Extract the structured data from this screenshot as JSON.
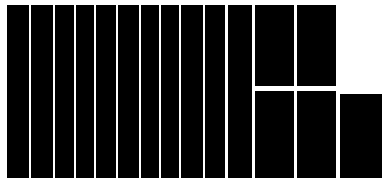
{
  "figure": {
    "background_color": "#ffffff",
    "tile_color": "#000000",
    "width": 389,
    "height": 189
  },
  "chart_data": {
    "type": "treemap",
    "title": "",
    "subtitle": "",
    "xlabel": "",
    "ylabel": "",
    "grid": false,
    "legend": "none",
    "labels_shown": false,
    "axis_shown": false,
    "layout": "squarified-treemap",
    "canvas": {
      "x": 0,
      "y": 0,
      "width": 389,
      "height": 189
    },
    "plot_area": {
      "x": 7,
      "y": 5,
      "width": 375,
      "height": 173
    },
    "tile_color": "#000000",
    "background_color": "#ffffff",
    "tile_count": 15,
    "tiles": [
      {
        "index": 0,
        "x": 7,
        "y": 5,
        "width": 22,
        "height": 173,
        "area": 3806,
        "value": 3806
      },
      {
        "index": 1,
        "x": 31,
        "y": 5,
        "width": 22,
        "height": 173,
        "area": 3806,
        "value": 3806
      },
      {
        "index": 2,
        "x": 55,
        "y": 5,
        "width": 19,
        "height": 173,
        "area": 3287,
        "value": 3287
      },
      {
        "index": 3,
        "x": 76,
        "y": 5,
        "width": 18,
        "height": 173,
        "area": 3114,
        "value": 3114
      },
      {
        "index": 4,
        "x": 96,
        "y": 5,
        "width": 20,
        "height": 173,
        "area": 3460,
        "value": 3460
      },
      {
        "index": 5,
        "x": 118,
        "y": 5,
        "width": 21,
        "height": 173,
        "area": 3633,
        "value": 3633
      },
      {
        "index": 6,
        "x": 141,
        "y": 5,
        "width": 18,
        "height": 173,
        "area": 3114,
        "value": 3114
      },
      {
        "index": 7,
        "x": 161,
        "y": 5,
        "width": 18,
        "height": 173,
        "area": 3114,
        "value": 3114
      },
      {
        "index": 8,
        "x": 181,
        "y": 5,
        "width": 22,
        "height": 173,
        "area": 3806,
        "value": 3806
      },
      {
        "index": 9,
        "x": 205,
        "y": 5,
        "width": 20,
        "height": 173,
        "area": 3460,
        "value": 3460
      },
      {
        "index": 10,
        "x": 228,
        "y": 5,
        "width": 24,
        "height": 173,
        "area": 4152,
        "value": 4152
      },
      {
        "index": 11,
        "x": 255,
        "y": 5,
        "width": 39,
        "height": 81,
        "area": 3159,
        "value": 3159
      },
      {
        "index": 12,
        "x": 297,
        "y": 5,
        "width": 39,
        "height": 81,
        "area": 3159,
        "value": 3159
      },
      {
        "index": 13,
        "x": 255,
        "y": 91,
        "width": 39,
        "height": 87,
        "area": 3393,
        "value": 3393
      },
      {
        "index": 14,
        "x": 297,
        "y": 91,
        "width": 39,
        "height": 87,
        "area": 3393,
        "value": 3393
      },
      {
        "index": 15,
        "x": 340,
        "y": 94,
        "width": 42,
        "height": 84,
        "area": 3528,
        "value": 3528
      }
    ]
  }
}
